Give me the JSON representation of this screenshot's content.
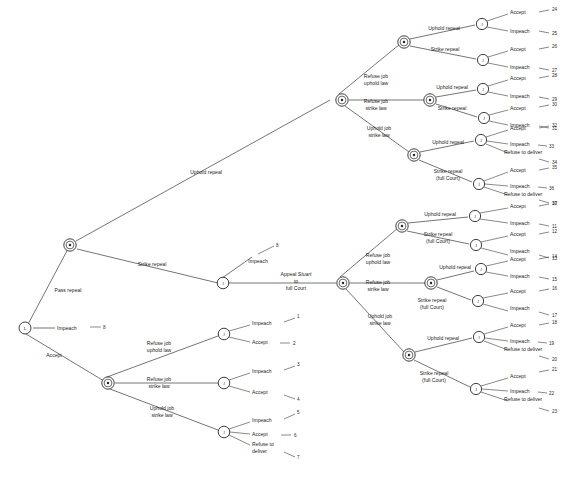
{
  "figure": {
    "caption": ""
  },
  "players": {
    "legislature": "L",
    "court": "J",
    "executive": "E"
  },
  "node_glyphs": {
    "open_circle_j": "J",
    "double_circle_e": "E",
    "root": "L"
  },
  "labels": {
    "pass_repeal": "Pass repeal",
    "impeach": "Impeach",
    "accept": "Accept",
    "strike_repeal": "Strike repeal",
    "uphold_repeal": "Uphold repeal",
    "strike_repeal_full_court": "Strike repeal\n(full Court)",
    "refuse_job_uphold_law": "Refuse job\nuphold law",
    "refuse_job_strike_law": "Refuse job\nstrike law",
    "uphold_job_strike_law": "Uphold job\nstrike law",
    "refuse_to_deliver": "Refuse to deliver",
    "refuse_to_deliver_wrapped": "Refuse to\ndeliver",
    "appeal_line1": "Appeal ",
    "appeal_italic": "Stuart",
    "appeal_line2": "to",
    "appeal_line3": "full Court"
  },
  "edge_labels": [
    {
      "id": "pass-repeal",
      "text": "Pass repeal",
      "x": 68,
      "y": 290,
      "anchor": "middle",
      "rotate": 0
    },
    {
      "id": "impeach-root",
      "text": "Impeach",
      "x": 58,
      "y": 327,
      "anchor": "start",
      "rotate": 0
    },
    {
      "id": "accept-root",
      "text": "Accept",
      "x": 52,
      "y": 355,
      "anchor": "middle",
      "rotate": 0
    },
    {
      "id": "uphold-repeal-top",
      "text": "Uphold repeal",
      "x": 205,
      "y": 172,
      "anchor": "middle",
      "rotate": 0
    },
    {
      "id": "strike-repeal-mid",
      "text": "Strike repeal",
      "x": 150,
      "y": 265,
      "anchor": "middle",
      "rotate": 0
    },
    {
      "id": "impeach-l2",
      "text": "Impeach",
      "x": 258,
      "y": 262,
      "anchor": "middle",
      "rotate": 0
    }
  ],
  "payoffs": [
    {
      "n": "1"
    },
    {
      "n": "2"
    },
    {
      "n": "3"
    },
    {
      "n": "4"
    },
    {
      "n": "5"
    },
    {
      "n": "6"
    },
    {
      "n": "7"
    },
    {
      "n": "8"
    },
    {
      "n": "10"
    },
    {
      "n": "11"
    },
    {
      "n": "12"
    },
    {
      "n": "13"
    },
    {
      "n": "14"
    },
    {
      "n": "15"
    },
    {
      "n": "16"
    },
    {
      "n": "17"
    },
    {
      "n": "18"
    },
    {
      "n": "19"
    },
    {
      "n": "20"
    },
    {
      "n": "21"
    },
    {
      "n": "22"
    },
    {
      "n": "23"
    },
    {
      "n": "24"
    },
    {
      "n": "25"
    },
    {
      "n": "26"
    },
    {
      "n": "27"
    },
    {
      "n": "28"
    },
    {
      "n": "29"
    },
    {
      "n": "30"
    },
    {
      "n": "31"
    },
    {
      "n": "32"
    },
    {
      "n": "33"
    },
    {
      "n": "34"
    },
    {
      "n": "35"
    },
    {
      "n": "36"
    },
    {
      "n": "37"
    }
  ],
  "branch_top": {
    "name": "Uphold repeal branch",
    "subbranches": [
      {
        "label": "Refuse job\nuphold law",
        "children": [
          {
            "label": "Uphold repeal",
            "terminals": [
              {
                "label": "Accept",
                "n": "24"
              },
              {
                "label": "Impeach",
                "n": "25"
              }
            ]
          },
          {
            "label": "Strike repeal",
            "terminals": [
              {
                "label": "Accept",
                "n": "26"
              },
              {
                "label": "Impeach",
                "n": "27"
              }
            ]
          }
        ]
      },
      {
        "label": "Refuse job\nstrike law",
        "children": [
          {
            "label": "Uphold repeal",
            "terminals": [
              {
                "label": "Accept",
                "n": "28"
              },
              {
                "label": "Impeach",
                "n": "29"
              }
            ]
          },
          {
            "label": "Strike repeal",
            "terminals": [
              {
                "label": "Accept",
                "n": "30"
              },
              {
                "label": "Impeach",
                "n": "31"
              }
            ]
          }
        ]
      },
      {
        "label": "Uphold job\nstrike law",
        "children": [
          {
            "label": "Uphold repeal",
            "terminals": [
              {
                "label": "Accept",
                "n": "32"
              },
              {
                "label": "Impeach",
                "n": "33"
              },
              {
                "label": "Refuse to deliver",
                "n": "34"
              }
            ]
          },
          {
            "label": "Strike repeal\n(full Court)",
            "terminals": [
              {
                "label": "Accept",
                "n": "35"
              },
              {
                "label": "Impeach",
                "n": "36"
              },
              {
                "label": "Refuse to deliver",
                "n": "37"
              }
            ]
          }
        ]
      }
    ]
  },
  "branch_appeal": {
    "name": "Appeal Stuart to full Court branch",
    "subbranches": [
      {
        "label": "Refuse job\nuphold law",
        "children": [
          {
            "label": "Uphold repeal",
            "terminals": [
              {
                "label": "Accept",
                "n": "10"
              },
              {
                "label": "Impeach",
                "n": "11"
              }
            ]
          },
          {
            "label": "Strike repeal\n(full Court)",
            "terminals": [
              {
                "label": "Accept",
                "n": "12"
              },
              {
                "label": "Impeach",
                "n": "13"
              }
            ]
          }
        ]
      },
      {
        "label": "Refuse job\nstrike law",
        "children": [
          {
            "label": "Uphold repeal",
            "terminals": [
              {
                "label": "Accept",
                "n": "14"
              },
              {
                "label": "Impeach",
                "n": "15"
              }
            ]
          },
          {
            "label": "Strike repeal\n(full Court)",
            "terminals": [
              {
                "label": "Accept",
                "n": "16"
              },
              {
                "label": "Impeach",
                "n": "17"
              }
            ]
          }
        ]
      },
      {
        "label": "Uphold job\nstrike law",
        "children": [
          {
            "label": "Uphold repeal",
            "terminals": [
              {
                "label": "Accept",
                "n": "18"
              },
              {
                "label": "Impeach",
                "n": "19"
              },
              {
                "label": "Refuse to deliver",
                "n": "20"
              }
            ]
          },
          {
            "label": "Strike repeal\n(full Court)",
            "terminals": [
              {
                "label": "Accept",
                "n": "21"
              },
              {
                "label": "Impeach",
                "n": "22"
              },
              {
                "label": "Refuse to deliver",
                "n": "23"
              }
            ]
          }
        ]
      }
    ]
  },
  "branch_accept": {
    "name": "Accept branch",
    "subbranches": [
      {
        "label": "Refuse job\nuphold law",
        "terminals": [
          {
            "label": "Impeach",
            "n": "1"
          },
          {
            "label": "Accept",
            "n": "2"
          }
        ]
      },
      {
        "label": "Refuse job\nstrike law",
        "terminals": [
          {
            "label": "Impeach",
            "n": "3"
          },
          {
            "label": "Accept",
            "n": "4"
          }
        ]
      },
      {
        "label": "Uphold job\nstrike law",
        "terminals": [
          {
            "label": "Impeach",
            "n": "5"
          },
          {
            "label": "Accept",
            "n": "6"
          },
          {
            "label": "Refuse to\ndeliver",
            "n": "7"
          }
        ]
      }
    ]
  }
}
